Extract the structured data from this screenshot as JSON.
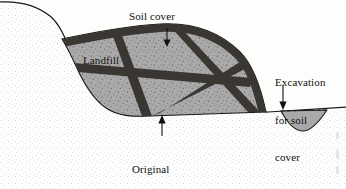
{
  "figure": {
    "background_color": "#fdfdfb",
    "line_color": "#1a1a1a",
    "labels": {
      "soil_cover": "Soil cover",
      "landfill": "Landfill",
      "excavation_line1": "Excavation",
      "excavation_line2": "for soil",
      "excavation_line3": "cover",
      "original_line1": "Original",
      "original_line2": "ground",
      "original_line3": "surface"
    }
  },
  "diagram_data": {
    "type": "cross-section",
    "regions": [
      {
        "name": "native-soil",
        "label": "Original ground surface",
        "fill": "stipple",
        "fill_color": "#ffffff",
        "stipple_color": "#8c8c8c"
      },
      {
        "name": "landfill-body",
        "label": "Landfill",
        "fill": "speckled-gray",
        "fill_color": "#a9a9a9",
        "speckle_color": "#4a4a4a"
      },
      {
        "name": "soil-cover-bands",
        "label": "Soil cover",
        "fill": "solid-dark",
        "fill_color": "#3a3632"
      },
      {
        "name": "excavation-pit",
        "label": "Excavation for soil cover",
        "fill": "solid-gray",
        "fill_color": "#a9a9a9",
        "top_line_style": "dashed"
      }
    ],
    "annotations": [
      {
        "name": "soil-cover",
        "arrow": "down",
        "target": "landfill cap band"
      },
      {
        "name": "landfill",
        "arrow": "none",
        "target": "landfill body"
      },
      {
        "name": "excavation-for-soil-cover",
        "arrow": "down",
        "target": "excavation pit"
      },
      {
        "name": "original-ground-surface",
        "arrow": "up",
        "target": "native ground line beneath landfill"
      }
    ]
  }
}
